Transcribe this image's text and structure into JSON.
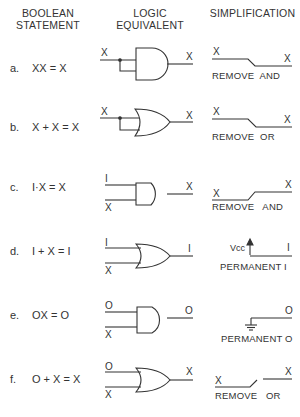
{
  "headers": {
    "col1": [
      "BOOLEAN",
      "STATEMENT"
    ],
    "col2": [
      "LOGIC",
      "EQUIVALENT"
    ],
    "col3": [
      "SIMPLIFICATION"
    ]
  },
  "rows": [
    {
      "letter": "a.",
      "statement": "XX = X",
      "gate": "AND",
      "in1": "X",
      "in2": "",
      "out": "X",
      "simp_left": "X",
      "simp_right": "X",
      "caption": "REMOVE  AND"
    },
    {
      "letter": "b.",
      "statement": "X + X = X",
      "gate": "OR",
      "in1": "X",
      "in2": "",
      "out": "X",
      "simp_left": "X",
      "simp_right": "X",
      "caption": "REMOVE  OR"
    },
    {
      "letter": "c.",
      "statement": "I·X = X",
      "gate": "AND",
      "in1": "I",
      "in2": "X",
      "out": "X",
      "simp_left": "X",
      "simp_right": "X",
      "caption": "REMOVE   AND"
    },
    {
      "letter": "d.",
      "statement": "I + X = I",
      "gate": "OR",
      "in1": "I",
      "in2": "X",
      "out": "I",
      "simp_left": "Vcc",
      "simp_right": "I",
      "caption": "PERMANENT I"
    },
    {
      "letter": "e.",
      "statement": "OX = O",
      "gate": "AND",
      "in1": "O",
      "in2": "X",
      "out": "O",
      "simp_left": "",
      "simp_right": "O",
      "caption": "PERMANENT O"
    },
    {
      "letter": "f.",
      "statement": "O + X = X",
      "gate": "OR",
      "in1": "O",
      "in2": "X",
      "out": "X",
      "simp_left": "X",
      "simp_right": "X",
      "caption": "REMOVE   OR"
    }
  ]
}
